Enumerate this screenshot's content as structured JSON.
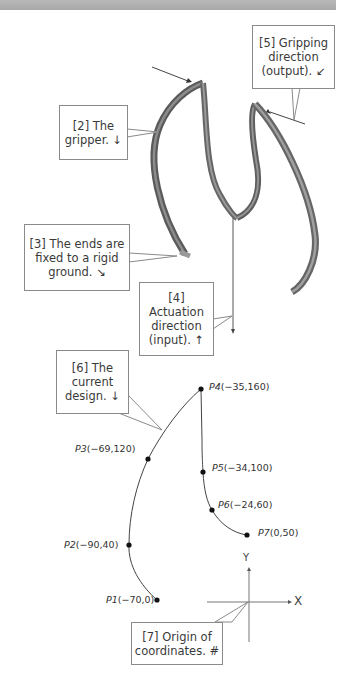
{
  "figure": {
    "top_bar": true,
    "callouts": [
      {
        "id": "2",
        "lines": [
          "[2] The",
          "gripper. ↓"
        ]
      },
      {
        "id": "3",
        "lines": [
          "[3] The ends are",
          "fixed to a rigid",
          "ground. ↘"
        ]
      },
      {
        "id": "4",
        "lines": [
          "[4]",
          "Actuation",
          "direction",
          "(input). ↑"
        ]
      },
      {
        "id": "5",
        "lines": [
          "[5] Gripping",
          "direction",
          "(output). ↙"
        ]
      },
      {
        "id": "6",
        "lines": [
          "[6] The",
          "current",
          "design. ↓"
        ]
      },
      {
        "id": "7",
        "lines": [
          "[7] Origin of",
          "coordinates. #"
        ]
      }
    ],
    "points": [
      {
        "name": "P1",
        "coords": "(−70,0)",
        "x": -70,
        "y": 0
      },
      {
        "name": "P2",
        "coords": "(−90,40)",
        "x": -90,
        "y": 40
      },
      {
        "name": "P3",
        "coords": "(−69,120)",
        "x": -69,
        "y": 120
      },
      {
        "name": "P4",
        "coords": "(−35,160)",
        "x": -35,
        "y": 160
      },
      {
        "name": "P5",
        "coords": "(−34,100)",
        "x": -34,
        "y": 100
      },
      {
        "name": "P6",
        "coords": "(−24,60)",
        "x": -24,
        "y": 60
      },
      {
        "name": "P7",
        "coords": "(0,50)",
        "x": 0,
        "y": 50
      }
    ],
    "axes": {
      "x_label": "X",
      "y_label": "Y"
    },
    "colors": {
      "ribbon_dark": "#5e5e5e",
      "ribbon_light": "#9a9a9a",
      "line": "#444444",
      "callout_border": "#8a8a8a"
    }
  }
}
